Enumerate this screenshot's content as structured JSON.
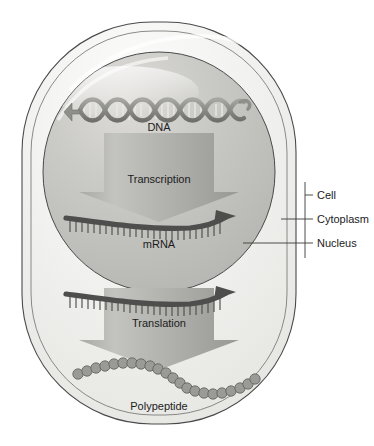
{
  "figure": {
    "background_color": "#ffffff"
  },
  "cell": {
    "name": "cell",
    "fill": "#f2f2f0",
    "stroke": "#4a4a4a"
  },
  "nucleus": {
    "name": "nucleus",
    "fill": "#c9c9c6",
    "stroke": "#4a4a4a"
  },
  "stages": {
    "dna": {
      "label": "DNA",
      "color": "#8e8e8b"
    },
    "transcription": {
      "label": "Transcription",
      "arrow_fill_light": "#b9b9b6",
      "arrow_fill_dark": "#8f8f8c"
    },
    "mrna_nuclear": {
      "label": "mRNA",
      "color": "#4e4e4c"
    },
    "mrna_cytoplasmic": {
      "label": "",
      "color": "#4e4e4c"
    },
    "translation": {
      "label": "Translation",
      "arrow_fill_light": "#b9b9b6",
      "arrow_fill_dark": "#8f8f8c"
    },
    "polypeptide": {
      "label": "Polypeptide",
      "bead_fill": "#9a9a97",
      "bead_stroke": "#5d5d5a",
      "bead_count": 28
    }
  },
  "callouts": [
    {
      "key": "cell",
      "label": "Cell"
    },
    {
      "key": "cytoplasm",
      "label": "Cytoplasm"
    },
    {
      "key": "nucleus",
      "label": "Nucleus"
    }
  ]
}
